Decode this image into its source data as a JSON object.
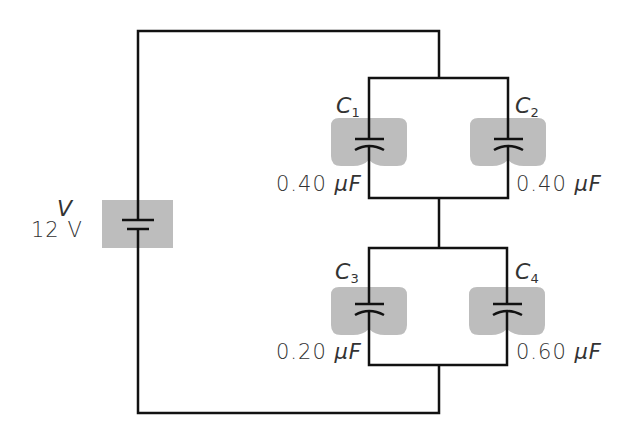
{
  "diagram": {
    "type": "circuit",
    "source": {
      "symbol": "V",
      "value": "12 V"
    },
    "capacitors": [
      {
        "name": "C",
        "index": "1",
        "value": "0.40",
        "unit": "μF"
      },
      {
        "name": "C",
        "index": "2",
        "value": "0.40",
        "unit": "μF"
      },
      {
        "name": "C",
        "index": "3",
        "value": "0.20",
        "unit": "μF"
      },
      {
        "name": "C",
        "index": "4",
        "value": "0.60",
        "unit": "μF"
      }
    ],
    "topology": "C1 ∥ C2 in series with C3 ∥ C4, across V",
    "colors": {
      "wire": "#111111",
      "highlight": "#bdbdbd",
      "background": "#ffffff"
    }
  }
}
